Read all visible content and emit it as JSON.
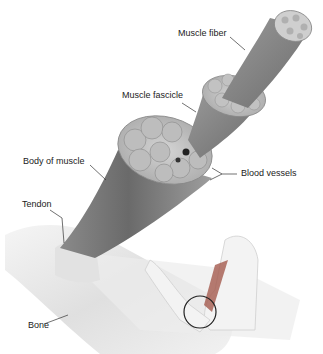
{
  "diagram": {
    "type": "anatomy-illustration",
    "labels": [
      {
        "id": "muscle-fiber",
        "text": "Muscle fiber"
      },
      {
        "id": "muscle-fascicle",
        "text": "Muscle fascicle"
      },
      {
        "id": "body-of-muscle",
        "text": "Body of muscle"
      },
      {
        "id": "blood-vessels",
        "text": "Blood vessels"
      },
      {
        "id": "tendon",
        "text": "Tendon"
      },
      {
        "id": "bone",
        "text": "Bone"
      }
    ],
    "colors": {
      "background": "#ffffff",
      "muscle_dark": "#6e6e6e",
      "muscle_mid": "#9a9a9a",
      "muscle_light": "#c8c8c8",
      "bone": "#e6e6e6",
      "callout_line": "#333333",
      "label_text": "#222222"
    }
  }
}
